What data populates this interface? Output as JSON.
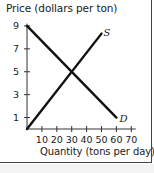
{
  "chart_data": {
    "type": "line",
    "title": "",
    "ylabel": "Price (dollars per ton)",
    "xlabel": "Quantity (tons per day)",
    "xlim": [
      0,
      70
    ],
    "ylim": [
      0,
      9
    ],
    "x_ticks": [
      10,
      20,
      30,
      40,
      50,
      60,
      70
    ],
    "y_ticks": [
      1,
      3,
      5,
      7,
      9
    ],
    "grid": false,
    "legend": "inline labels at line ends",
    "series": [
      {
        "name": "S",
        "label": "S",
        "points": [
          [
            0,
            0
          ],
          [
            50,
            8.33
          ]
        ]
      },
      {
        "name": "D",
        "label": "D",
        "points": [
          [
            0,
            9
          ],
          [
            60,
            1
          ]
        ]
      }
    ],
    "equilibrium": {
      "quantity": 30,
      "price": 5
    }
  },
  "axes": {
    "y_title": "Price (dollars per ton)",
    "x_title": "Quantity (tons per day)",
    "x_tick_labels": [
      "10",
      "20",
      "30",
      "40",
      "50",
      "60",
      "70"
    ],
    "y_tick_labels": [
      "1",
      "3",
      "5",
      "7",
      "9"
    ]
  },
  "curves": {
    "supply_label": "S",
    "demand_label": "D"
  },
  "colors": {
    "line": "#111111",
    "axis": "#333333",
    "text": "#1a1a1a"
  }
}
